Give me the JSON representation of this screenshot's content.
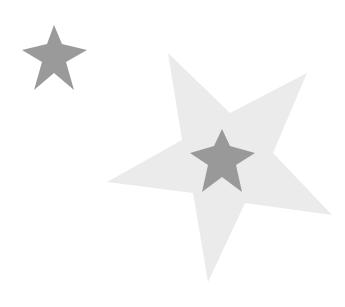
{
  "canvas": {
    "width": 345,
    "height": 307,
    "background": "#ffffff"
  },
  "shapes": [
    {
      "name": "small-star",
      "color": "#9a9a9a",
      "points": "54,25 62,44 87,50 66,62 74,90 54,73 34,90 42,62 22,50 47,44"
    },
    {
      "name": "large-light-star",
      "color": "#ebebeb",
      "points": "168,53 230,113 307,73 273,153 332,215 245,203 208,282 193,193 107,182 182,140"
    },
    {
      "name": "inner-dark-star",
      "color": "#999999",
      "points": "222,129 230,146 255,153 236,165 242,192 222,177 202,192 208,165 190,153 214,146"
    }
  ]
}
